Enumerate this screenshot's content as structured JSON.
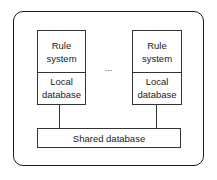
{
  "diagram": {
    "type": "architecture",
    "container": {
      "shape": "rounded-rectangle"
    },
    "nodes": [
      {
        "id": "node1",
        "top_label": [
          "Rule",
          "system"
        ],
        "bottom_label": [
          "Local",
          "database"
        ]
      },
      {
        "id": "node2",
        "top_label": [
          "Rule",
          "system"
        ],
        "bottom_label": [
          "Local",
          "database"
        ]
      }
    ],
    "ellipsis": "...",
    "shared": {
      "label": "Shared database"
    },
    "edges": [
      {
        "from": "node1.local_database",
        "to": "shared"
      },
      {
        "from": "node2.local_database",
        "to": "shared"
      }
    ]
  }
}
